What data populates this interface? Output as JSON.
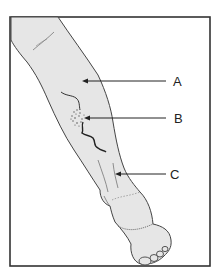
{
  "figure": {
    "frame_color": "#333333",
    "skin_color": "#e6e6e6",
    "line_color": "#444444"
  },
  "labels": [
    {
      "id": "A",
      "text": "A",
      "x": 173,
      "y": 75,
      "arrow": {
        "x1": 166,
        "y1": 81,
        "x2": 83,
        "y2": 81
      }
    },
    {
      "id": "B",
      "text": "B",
      "x": 174,
      "y": 112,
      "arrow": {
        "x1": 166,
        "y1": 118,
        "x2": 84,
        "y2": 118
      }
    },
    {
      "id": "C",
      "text": "C",
      "x": 170,
      "y": 168,
      "arrow": {
        "x1": 166,
        "y1": 174,
        "x2": 115,
        "y2": 174
      }
    }
  ]
}
